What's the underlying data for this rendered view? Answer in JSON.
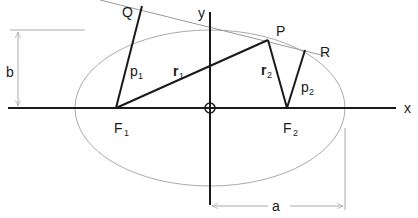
{
  "diagram": {
    "labels": {
      "x_axis": "x",
      "y_axis": "y",
      "point_P": "P",
      "point_Q": "Q",
      "point_R": "R",
      "focus_1": "F",
      "focus_1_sub": "1",
      "focus_2": "F",
      "focus_2_sub": "2",
      "radius_1": "r",
      "radius_1_sub": "1",
      "radius_2": "r",
      "radius_2_sub": "2",
      "perp_1": "p",
      "perp_1_sub": "1",
      "perp_2": "p",
      "perp_2_sub": "2",
      "semi_major": "a",
      "semi_minor": "b"
    },
    "colors": {
      "axis": "#1a1a1a",
      "ellipse": "#aaaaaa",
      "tangent": "#999999",
      "dimension": "#aaaaaa"
    }
  }
}
